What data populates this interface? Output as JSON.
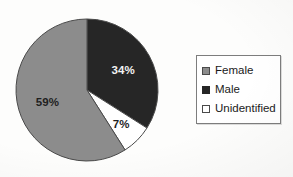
{
  "chart_data": {
    "type": "pie",
    "title": "",
    "subtitle": "",
    "xlabel": "",
    "ylabel": "",
    "grid": false,
    "legend_position": "right",
    "start_angle_deg": 0,
    "direction": "clockwise",
    "categories": [
      "Male",
      "Unidentified",
      "Female"
    ],
    "values": [
      34,
      7,
      59
    ],
    "value_unit": "%",
    "slices": [
      {
        "label": "Male",
        "value": 34,
        "data_label": "34%",
        "color": "#262626",
        "label_text_color": "#f2f2f2",
        "start_deg": 0,
        "end_deg": 122.4
      },
      {
        "label": "Unidentified",
        "value": 7,
        "data_label": "7%",
        "color": "#ffffff",
        "label_text_color": "#1f1f1f",
        "start_deg": 122.4,
        "end_deg": 147.6
      },
      {
        "label": "Female",
        "value": 59,
        "data_label": "59%",
        "color": "#8c8c8c",
        "label_text_color": "#1f1f1f",
        "start_deg": 147.6,
        "end_deg": 360
      }
    ],
    "legend": [
      {
        "label": "Female",
        "swatch_color": "#8c8c8c",
        "swatch_border": "#4a4a4a"
      },
      {
        "label": "Male",
        "swatch_color": "#262626",
        "swatch_border": "#262626"
      },
      {
        "label": "Unidentified",
        "swatch_color": "#ffffff",
        "swatch_border": "#4a4a4a"
      }
    ],
    "geometry": {
      "center_x": 87,
      "center_y": 90,
      "radius": 71
    },
    "colors": {
      "female": "#8c8c8c",
      "male": "#262626",
      "unidentified": "#ffffff",
      "outline": "#4a4a4a",
      "legend_border": "#7d7d7d",
      "background": "#fdfdfc"
    }
  }
}
